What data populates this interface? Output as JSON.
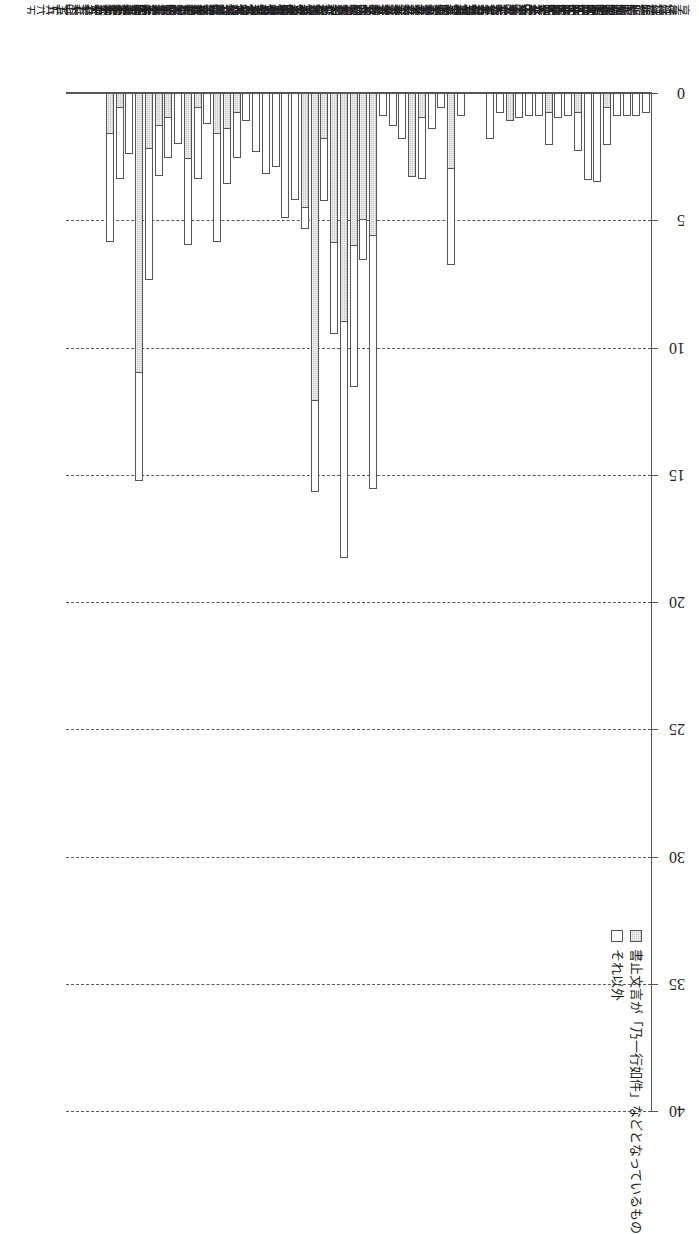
{
  "chart_data": {
    "type": "bar",
    "orientation": "horizontal-stacked-rotated",
    "title": "",
    "xlabel": "",
    "ylabel": "",
    "xlim": [
      0,
      40
    ],
    "xticks": [
      0,
      5,
      10,
      15,
      20,
      25,
      30,
      35,
      40
    ],
    "ticklabels": [
      "0",
      "5",
      "10",
      "15",
      "20",
      "25",
      "30",
      "35",
      "40"
    ],
    "grid": "dashed-vertical",
    "legend_position": "top-right",
    "series": [
      {
        "name": "書止文言が「乃一行如件」などとなっているもの",
        "key": "a",
        "fill": "#c9c9c9",
        "pattern": "dotted-hatch"
      },
      {
        "name": "それ以外",
        "key": "b",
        "fill": "#ffffff",
        "pattern": "solid"
      }
    ],
    "categories": [
      "享徳二(一四五三)",
      "享徳三(一四五四)",
      "延徳二(一四九〇)",
      "延徳三(一四九一)",
      "明応五(一四九六)",
      "明応六(一四九七)",
      "明応七(一四九八)",
      "明応八(一四九九)",
      "永正二(一五〇五)",
      "永正三(一五〇六)",
      "永正五(一五〇八)",
      "永正七(一五一〇)",
      "永正一〇(一五一三)",
      "永正一二(一五一五)",
      "永正一五(一五一八)",
      "永正一七(一五二〇)",
      "大永二(一五二二)",
      "大永三(一五二三)",
      "大永五(一五二五)",
      "大永七(一五二七)",
      "享禄二(一五二九)",
      "享禄三(一五三〇)",
      "享禄四(一五三一)",
      "天文二(一五三三)",
      "天文五(一五三六)",
      "天文九(一五四〇)",
      "天文一二(一五四三)",
      "天文一五(一五四六)",
      "天文一七(一五四八)",
      "天文一九(一五五〇)",
      "天文二一(一五五二)",
      "天文二三(一五五四)",
      "弘治元(一五五五)",
      "弘治二(一五五六)",
      "弘治三(一五五七)",
      "永禄元(一五五八)",
      "永禄二(一五五九)",
      "永禄三(一五六〇)",
      "永禄四(一五六一)",
      "永禄五(一五六二)",
      "永禄六(一五六三)",
      "永禄七(一五六四)",
      "永禄八(一五六五)",
      "永禄九(一五六六)",
      "永禄一〇(一五六七)",
      "永禄一一(一五六八)",
      "永禄一二(一五六九)",
      "元亀元(一五七〇)",
      "元亀二(一五七一)",
      "元亀三(一五七二)",
      "元亀四(一五七三)",
      "天正二(一五七四)",
      "天正三(一五七五)",
      "天正四(一五七六)",
      "天正五(一五七七)",
      "天正六(一五七八)",
      "天正七(一五七九)",
      "天正八(一五八〇)",
      "天正九(一五八一)",
      "天正一〇(一五八二)"
    ],
    "values_a": [
      0,
      0,
      0,
      0,
      0.6,
      0,
      0,
      0.8,
      0,
      0,
      0.8,
      0,
      0,
      0,
      1.1,
      0,
      0,
      0,
      0,
      0,
      3.0,
      0,
      0,
      1.0,
      3.3,
      0,
      0,
      0,
      5.6,
      5.0,
      6.0,
      9.0,
      5.9,
      1.8,
      12.1,
      4.5,
      0,
      0,
      0,
      0,
      0,
      0,
      0.8,
      1.4,
      1.6,
      0,
      0.6,
      2.6,
      0,
      1.0,
      1.3,
      2.2,
      11.0,
      0,
      0.6,
      1.6,
      0,
      0,
      0,
      0
    ],
    "values_b": [
      0.8,
      0.9,
      0.9,
      0.9,
      1.5,
      3.5,
      3.4,
      1.5,
      0.9,
      1.0,
      1.3,
      0.9,
      0.9,
      1.0,
      0.0,
      0.8,
      1.8,
      0,
      0,
      0.9,
      3.8,
      0.6,
      1.4,
      2.4,
      0,
      1.8,
      1.3,
      0.9,
      10.0,
      1.6,
      5.6,
      9.3,
      3.6,
      2.5,
      3.6,
      0.9,
      4.2,
      4.9,
      2.9,
      3.2,
      2.3,
      1.1,
      1.8,
      2.2,
      4.3,
      1.2,
      2.8,
      3.4,
      2.0,
      1.6,
      2.0,
      5.2,
      4.3,
      2.4,
      2.8,
      4.3,
      0,
      0,
      0,
      0
    ]
  },
  "legend": {
    "items": [
      {
        "label": "書止文言が「乃一行如件」などとなっているもの"
      },
      {
        "label": "それ以外"
      }
    ]
  },
  "axis": {
    "ticks": [
      "0",
      "5",
      "10",
      "15",
      "20",
      "25",
      "30",
      "35",
      "40"
    ]
  }
}
